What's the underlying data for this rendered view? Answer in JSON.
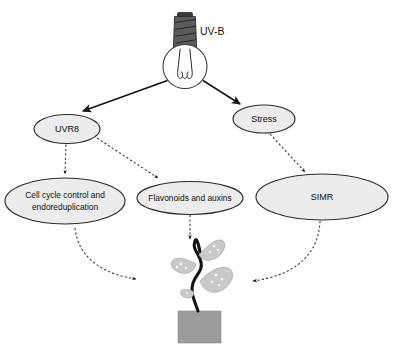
{
  "figure": {
    "background_color": "#ffffff"
  },
  "source": {
    "icon": "lightbulb-icon",
    "label": "UV-B"
  },
  "nodes": [
    {
      "id": "uvr8",
      "label": "UVR8",
      "shape": "ellipse",
      "cx": 67,
      "cy": 129,
      "rx": 33,
      "ry": 14.5
    },
    {
      "id": "stress",
      "label": "Stress",
      "shape": "ellipse",
      "cx": 264,
      "cy": 119,
      "rx": 31,
      "ry": 14
    },
    {
      "id": "cellcycle",
      "label_line1": "Cell cycle control and",
      "label_line2": "endoreduplication",
      "label": "Cell cycle control and endoreduplication",
      "shape": "ellipse",
      "cx": 65,
      "cy": 201,
      "rx": 60,
      "ry": 23
    },
    {
      "id": "flavonoids",
      "label": "Flavonoids and auxins",
      "shape": "ellipse",
      "cx": 190,
      "cy": 198,
      "rx": 53,
      "ry": 16.5
    },
    {
      "id": "simr",
      "label": "SIMR",
      "shape": "ellipse",
      "cx": 322,
      "cy": 197,
      "rx": 66,
      "ry": 23
    }
  ],
  "edges": [
    {
      "id": "uvb-to-uvr8",
      "from": "UV-B",
      "to": "UVR8",
      "style": "solid",
      "arrow": "filled-triangle"
    },
    {
      "id": "uvb-to-stress",
      "from": "UV-B",
      "to": "Stress",
      "style": "solid",
      "arrow": "filled-triangle"
    },
    {
      "id": "uvr8-to-cellcycle",
      "from": "UVR8",
      "to": "Cell cycle control and endoreduplication",
      "style": "dashed",
      "arrow": "small-triangle"
    },
    {
      "id": "uvr8-to-flavonoids",
      "from": "UVR8",
      "to": "Flavonoids and auxins",
      "style": "dashed",
      "arrow": "small-triangle"
    },
    {
      "id": "stress-to-simr",
      "from": "Stress",
      "to": "SIMR",
      "style": "dashed",
      "arrow": "small-triangle"
    },
    {
      "id": "cellcycle-to-plant",
      "from": "Cell cycle control and endoreduplication",
      "to": "seedling",
      "style": "dashed-curved",
      "arrow": "small-triangle"
    },
    {
      "id": "flavonoids-to-plant",
      "from": "Flavonoids and auxins",
      "to": "seedling",
      "style": "dashed",
      "arrow": "small-triangle"
    },
    {
      "id": "simr-to-plant",
      "from": "SIMR",
      "to": "seedling",
      "style": "dashed-curved",
      "arrow": "small-triangle"
    }
  ],
  "seedling": {
    "name": "seedling-illustration",
    "leaf_count": 4,
    "stem_color": "#141414",
    "leaf_color": "#c9c9c9",
    "pot_color": "#9b9b9b"
  },
  "colors": {
    "ellipse_fill": "#ececec",
    "ellipse_stroke": "#2b2b2b",
    "solid_edge": "#111111",
    "dashed_edge": "#3a3a3a",
    "bulb_base": "#5b5b5b",
    "text": "#111111"
  }
}
